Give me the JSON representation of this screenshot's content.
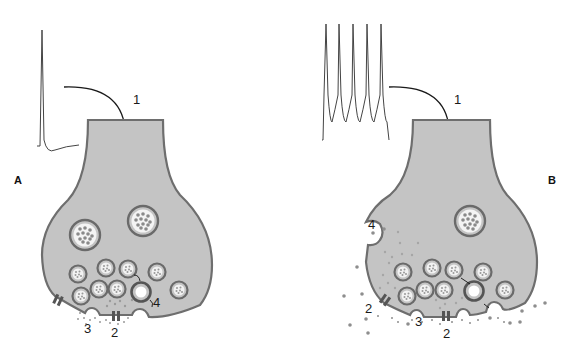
{
  "figure": {
    "panels": [
      {
        "id": "A",
        "label": "A",
        "description": "Single action potential triggers release of small vesicles at synapse",
        "stimulus": "single-spike",
        "labels": {
          "step1": "1",
          "step2": "2",
          "step3": "3",
          "step4": "4"
        }
      },
      {
        "id": "B",
        "label": "B",
        "description": "High-frequency burst triggers release of large dense-core vesicle contents",
        "stimulus": "spike-train",
        "spike_count": 5,
        "labels": {
          "step1": "1",
          "step2a": "2",
          "step2b": "2",
          "step3": "3",
          "step4": "4"
        }
      }
    ],
    "colors": {
      "terminal_fill": "#c4c4c4",
      "membrane": "#6e6e6e",
      "vesicle_ring": "#6a6a6a",
      "vesicle_core": "#f4f4f4",
      "dots": "#8e8e8e",
      "trace": "#444444",
      "arrow": "#1a1a1a"
    }
  }
}
